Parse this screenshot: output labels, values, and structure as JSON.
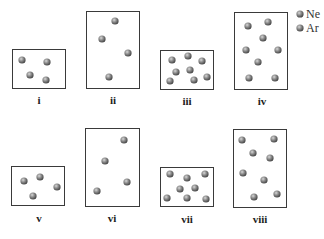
{
  "legend": {
    "items": [
      {
        "label": "Ne",
        "color": "#7a7a7a",
        "x": 300,
        "y": 14
      },
      {
        "label": "Ar",
        "color": "#7a7a7a",
        "x": 300,
        "y": 28
      }
    ]
  },
  "containers": [
    {
      "label": "i",
      "box": [
        12,
        49,
        53,
        39
      ],
      "label_pos": [
        39,
        104
      ],
      "particles": [
        [
          22,
          60
        ],
        [
          47,
          62
        ],
        [
          30,
          75
        ],
        [
          46,
          80
        ]
      ]
    },
    {
      "label": "ii",
      "box": [
        86,
        11,
        53,
        77
      ],
      "label_pos": [
        113,
        104
      ],
      "particles": [
        [
          115,
          21
        ],
        [
          102,
          39
        ],
        [
          128,
          53
        ],
        [
          109,
          77
        ]
      ]
    },
    {
      "label": "iii",
      "box": [
        160,
        50,
        53,
        39
      ],
      "label_pos": [
        187,
        105
      ],
      "particles": [
        [
          172,
          60
        ],
        [
          188,
          56
        ],
        [
          202,
          61
        ],
        [
          176,
          72
        ],
        [
          190,
          70
        ],
        [
          170,
          81
        ],
        [
          194,
          80
        ],
        [
          207,
          77
        ]
      ]
    },
    {
      "label": "iv",
      "box": [
        234,
        12,
        53,
        77
      ],
      "label_pos": [
        262,
        105
      ],
      "particles": [
        [
          248,
          26
        ],
        [
          268,
          22
        ],
        [
          263,
          38
        ],
        [
          246,
          50
        ],
        [
          278,
          50
        ],
        [
          258,
          62
        ],
        [
          249,
          78
        ],
        [
          275,
          78
        ]
      ]
    },
    {
      "label": "v",
      "box": [
        11,
        166,
        53,
        39
      ],
      "label_pos": [
        39,
        222
      ],
      "particles": [
        [
          24,
          181
        ],
        [
          40,
          177
        ],
        [
          57,
          187
        ],
        [
          33,
          196
        ]
      ]
    },
    {
      "label": "vi",
      "box": [
        85,
        128,
        54,
        78
      ],
      "label_pos": [
        112,
        222
      ],
      "particles": [
        [
          124,
          140
        ],
        [
          105,
          161
        ],
        [
          127,
          182
        ],
        [
          97,
          191
        ]
      ]
    },
    {
      "label": "vii",
      "box": [
        160,
        167,
        53,
        39
      ],
      "label_pos": [
        187,
        223
      ],
      "particles": [
        [
          170,
          174
        ],
        [
          187,
          178
        ],
        [
          205,
          174
        ],
        [
          180,
          189
        ],
        [
          195,
          188
        ],
        [
          167,
          198
        ],
        [
          187,
          198
        ],
        [
          206,
          199
        ]
      ]
    },
    {
      "label": "viii",
      "box": [
        233,
        129,
        53,
        78
      ],
      "label_pos": [
        260,
        223
      ],
      "particles": [
        [
          242,
          140
        ],
        [
          274,
          139
        ],
        [
          253,
          153
        ],
        [
          270,
          158
        ],
        [
          243,
          173
        ],
        [
          264,
          180
        ],
        [
          254,
          197
        ],
        [
          277,
          194
        ]
      ]
    }
  ]
}
